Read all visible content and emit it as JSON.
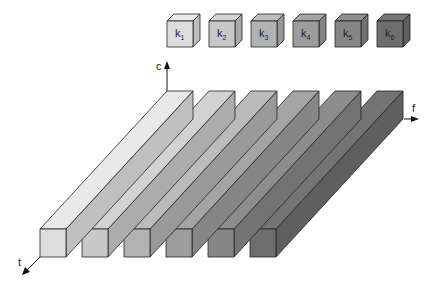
{
  "diagram": {
    "kernels": [
      {
        "label": "k",
        "sub": "1",
        "color": "#dedede"
      },
      {
        "label": "k",
        "sub": "2",
        "color": "#c8c8c8"
      },
      {
        "label": "k",
        "sub": "3",
        "color": "#b2b2b2"
      },
      {
        "label": "k",
        "sub": "4",
        "color": "#9c9c9c"
      },
      {
        "label": "k",
        "sub": "5",
        "color": "#868686"
      },
      {
        "label": "k",
        "sub": "6",
        "color": "#6e6e6e"
      }
    ],
    "axes": {
      "c": "c",
      "f": "f",
      "t": "t"
    }
  }
}
